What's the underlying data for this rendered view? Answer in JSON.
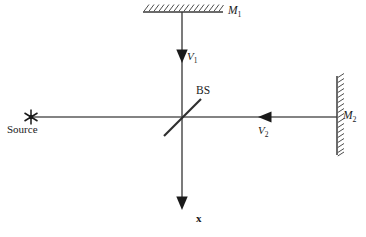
{
  "figure": {
    "kind": "optics-ray-diagram",
    "colors": {
      "line": "#5a5a5a",
      "ink": "#1a1a1a",
      "background": "#ffffff"
    },
    "labels": {
      "mirror_1": "M",
      "mirror_1_sub": "1",
      "mirror_2": "M",
      "mirror_2_sub": "2",
      "velocity_1": "V",
      "velocity_1_sub": "1",
      "velocity_2": "V",
      "velocity_2_sub": "2",
      "beam_splitter": "BS",
      "source": "Source",
      "axis_x": "x"
    },
    "elements": {
      "source_marker": "asterisk-star-icon",
      "mirror_1_marker": "hatched-mirror-horizontal",
      "mirror_2_marker": "hatched-mirror-vertical",
      "beam_splitter_marker": "diagonal-plate",
      "arrow_down_upper": "arrowhead-down",
      "arrow_down_lower": "arrowhead-down",
      "arrow_left": "arrowhead-left"
    },
    "geometry": {
      "center_x": 182,
      "center_y": 117,
      "vertical_top_y": 12,
      "vertical_bottom_y": 208,
      "horizontal_left_x": 31,
      "horizontal_right_x": 337,
      "mirror_1_x_from": 143,
      "mirror_1_x_to": 223,
      "mirror_2_y_from": 76,
      "mirror_2_y_to": 155
    }
  }
}
